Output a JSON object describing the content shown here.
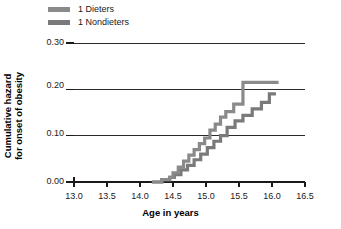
{
  "chart_data": {
    "type": "line",
    "subtype": "step-cumulative-hazard",
    "title": "",
    "xlabel": "Age in years",
    "ylabel_line1": "Cumulative hazard",
    "ylabel_line2": "for onset of obesity",
    "xlim": [
      13.0,
      16.5
    ],
    "ylim": [
      0.0,
      0.3
    ],
    "xticks": [
      "13.0",
      "13.5",
      "14.0",
      "14.5",
      "15.0",
      "15.5",
      "16.0",
      "16.5"
    ],
    "xtick_values": [
      13.0,
      13.5,
      14.0,
      14.5,
      15.0,
      15.5,
      16.0,
      16.5
    ],
    "yticks": [
      "0.00",
      "0.10",
      "0.20",
      "0.30"
    ],
    "ytick_values": [
      0.0,
      0.1,
      0.2,
      0.3
    ],
    "grid": "horizontal",
    "legend_position": "top-left-outside",
    "series": [
      {
        "name": "1 Dieters",
        "color": "#8a8a8a",
        "x": [
          14.18,
          14.33,
          14.45,
          14.5,
          14.58,
          14.66,
          14.74,
          14.82,
          14.9,
          14.98,
          15.06,
          15.14,
          15.22,
          15.3,
          15.42,
          15.56,
          16.1
        ],
        "y": [
          0.0,
          0.005,
          0.01,
          0.02,
          0.032,
          0.045,
          0.058,
          0.07,
          0.083,
          0.095,
          0.112,
          0.125,
          0.14,
          0.152,
          0.168,
          0.215,
          0.215
        ]
      },
      {
        "name": "1 Nondieters",
        "color": "#7a7a7a",
        "x": [
          14.18,
          14.33,
          14.45,
          14.52,
          14.62,
          14.72,
          14.82,
          14.92,
          15.02,
          15.12,
          15.22,
          15.32,
          15.44,
          15.56,
          15.7,
          15.84,
          15.96,
          16.06
        ],
        "y": [
          0.0,
          0.005,
          0.01,
          0.016,
          0.026,
          0.036,
          0.048,
          0.06,
          0.074,
          0.088,
          0.1,
          0.118,
          0.132,
          0.144,
          0.158,
          0.172,
          0.19,
          0.19
        ]
      }
    ]
  },
  "legend": {
    "items": [
      {
        "label": "1 Dieters",
        "color": "#8a8a8a"
      },
      {
        "label": "1 Nondieters",
        "color": "#7a7a7a"
      }
    ]
  },
  "axes": {
    "x_title": "Age in years",
    "y_title_line1": "Cumulative hazard",
    "y_title_line2": "for onset of obesity",
    "xticks": [
      "13.0",
      "13.5",
      "14.0",
      "14.5",
      "15.0",
      "15.5",
      "16.0",
      "16.5"
    ],
    "yticks": [
      "0.30",
      "0.20",
      "0.10",
      "0.00"
    ]
  },
  "colors": {
    "axis": "#1a1a1a",
    "grid": "#2b2b2b",
    "series_dieters": "#8a8a8a",
    "series_nondieters": "#7a7a7a",
    "background": "#ffffff"
  }
}
